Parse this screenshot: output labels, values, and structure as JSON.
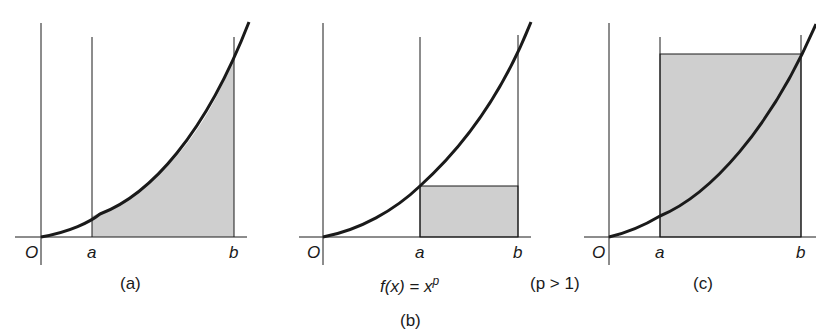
{
  "figure": {
    "function_label": "f(x) = x",
    "function_exponent": "p",
    "condition": "(p > 1)",
    "caption_b": "(b)",
    "colors": {
      "line": "#1a1a1a",
      "shade": "#cfcfcf",
      "background": "#ffffff"
    }
  },
  "panels": [
    {
      "id": "a",
      "caption": "(a)",
      "origin_label": "O",
      "a_label": "a",
      "b_label": "b",
      "shading": "area under curve from a to b"
    },
    {
      "id": "b",
      "caption": "",
      "origin_label": "O",
      "a_label": "a",
      "b_label": "b",
      "shading": "rectangle of height f(a) from a to b (lower sum)"
    },
    {
      "id": "c",
      "caption": "(c)",
      "origin_label": "O",
      "a_label": "a",
      "b_label": "b",
      "shading": "rectangle of height f(b) from a to b (upper sum)"
    }
  ]
}
